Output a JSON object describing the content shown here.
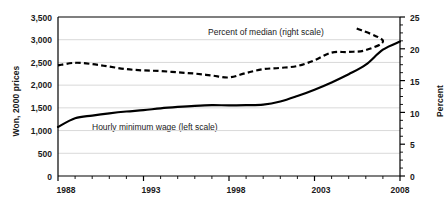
{
  "chart_data": {
    "type": "line",
    "title": "",
    "xlabel": "",
    "ylabel": "Won, 2000 prices",
    "ylabel_right": "Percent",
    "grid": true,
    "legend_position": "inline-annotations",
    "x": [
      1988,
      1989,
      1990,
      1991,
      1992,
      1993,
      1994,
      1995,
      1996,
      1997,
      1998,
      1999,
      2000,
      2001,
      2002,
      2003,
      2004,
      2005,
      2006,
      2007,
      2008
    ],
    "xlim": [
      1988,
      2008
    ],
    "ylim": [
      0,
      3500
    ],
    "ylim_right": [
      0,
      25
    ],
    "xtick_labels": [
      "1988",
      "1993",
      "1998",
      "2003",
      "2008"
    ],
    "xticks": [
      1988,
      1993,
      1998,
      2003,
      2008
    ],
    "ytick_labels_left": [
      "3,500",
      "3,000",
      "2,500",
      "2,000",
      "1,500",
      "1,000",
      "500",
      "0"
    ],
    "yticks_left": [
      3500,
      3000,
      2500,
      2000,
      1500,
      1000,
      500,
      0
    ],
    "ytick_labels_right": [
      "25",
      "20",
      "15",
      "10",
      "5",
      "0"
    ],
    "yticks_right": [
      25,
      20,
      15,
      10,
      5,
      0
    ],
    "series": [
      {
        "name": "Hourly minimum wage (left scale)",
        "axis": "left",
        "style": "solid",
        "color": "#000000",
        "values": [
          1080,
          1270,
          1330,
          1380,
          1420,
          1450,
          1490,
          1520,
          1545,
          1560,
          1555,
          1560,
          1570,
          1640,
          1760,
          1900,
          2060,
          2240,
          2450,
          2780,
          2960
        ]
      },
      {
        "name": "Percent  of median (right scale)",
        "axis": "right",
        "style": "dashed",
        "color": "#000000",
        "values": [
          17.4,
          17.8,
          17.6,
          17.2,
          16.8,
          16.6,
          16.5,
          16.3,
          16.1,
          15.8,
          15.5,
          16.2,
          16.8,
          17.0,
          17.3,
          18.2,
          19.4,
          19.5,
          19.8,
          21.3,
          23.3
        ]
      }
    ],
    "annotations": [
      {
        "text": "Percent  of median (right scale)",
        "x": 2000,
        "y_right": 24.0
      },
      {
        "text": "Hourly minimum wage (left scale)",
        "x": 1991.5,
        "y_left": 900
      }
    ]
  }
}
